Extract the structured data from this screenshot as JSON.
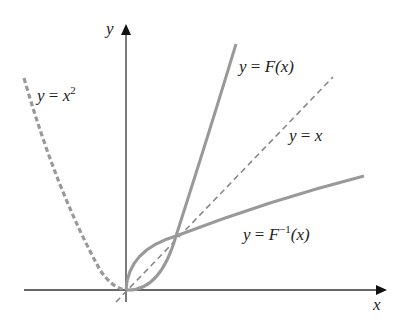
{
  "axes": {
    "x_label": "x",
    "y_label": "y",
    "color": "#333333"
  },
  "curves": {
    "parabola": {
      "label_lhs": "y",
      "label_eq": "=",
      "label_var": "x",
      "label_exp": "2",
      "style": "dashed-thick",
      "color": "#999999"
    },
    "function": {
      "label_lhs": "y",
      "label_eq": "=",
      "label_fn": "F",
      "label_arg": "(x)",
      "style": "solid",
      "color": "#999999"
    },
    "identity": {
      "label_lhs": "y",
      "label_eq": "=",
      "label_rhs": "x",
      "style": "dashed-thin",
      "color": "#888888"
    },
    "inverse": {
      "label_lhs": "y",
      "label_eq": "=",
      "label_fn": "F",
      "label_exp": "−1",
      "label_arg": "(x)",
      "style": "solid",
      "color": "#999999"
    }
  },
  "points": {
    "origin": [
      0,
      0
    ],
    "intersection": [
      1,
      1
    ]
  }
}
